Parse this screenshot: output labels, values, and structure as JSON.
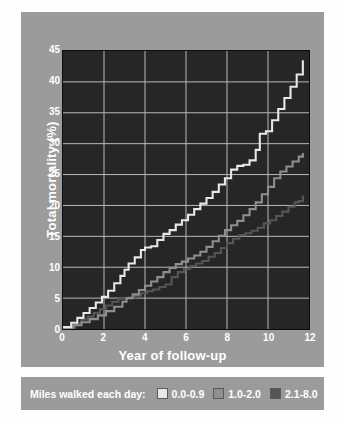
{
  "chart_data": {
    "type": "line",
    "title": "",
    "xlabel": "Year of follow-up",
    "ylabel": "Total mortality (%)",
    "xlim": [
      0,
      12
    ],
    "ylim": [
      0,
      45
    ],
    "xticks": [
      "0",
      "2",
      "4",
      "6",
      "8",
      "10",
      "12"
    ],
    "yticks": [
      "0",
      "5",
      "10",
      "15",
      "20",
      "25",
      "30",
      "35",
      "40",
      "45"
    ],
    "grid": true,
    "step_plot": true,
    "legend_position": "below-plot",
    "legend_title": "Miles walked each day:",
    "colors": {
      "panel_background": "#9b9b9b",
      "plot_background": "#262626",
      "grid": "#b9b9b9",
      "axis_text": "#ffffff",
      "series_0_0_9": "#e8e8e8",
      "series_1_0_2_0": "#8f8f8f",
      "series_2_1_8_0": "#555555"
    },
    "series": [
      {
        "name": "0.0-0.9",
        "color": "#e8e8e8",
        "x": [
          0,
          0.4,
          0.7,
          1.0,
          1.3,
          1.6,
          1.9,
          2.2,
          2.5,
          2.8,
          3.0,
          3.2,
          3.5,
          3.8,
          4.0,
          4.3,
          4.6,
          4.9,
          5.2,
          5.5,
          5.8,
          6.1,
          6.4,
          6.7,
          7.0,
          7.3,
          7.6,
          7.9,
          8.2,
          8.5,
          8.8,
          9.1,
          9.4,
          9.6,
          9.9,
          10.2,
          10.5,
          10.8,
          11.1,
          11.4,
          11.7
        ],
        "y": [
          0.3,
          1.0,
          1.8,
          2.6,
          3.4,
          4.3,
          5.2,
          6.2,
          7.4,
          8.6,
          9.6,
          10.6,
          11.6,
          12.8,
          13.2,
          13.4,
          14.4,
          15.4,
          16.0,
          16.9,
          17.6,
          18.5,
          19.4,
          20.3,
          21.2,
          22.2,
          23.4,
          24.4,
          25.8,
          26.4,
          26.6,
          27.3,
          29.0,
          31.6,
          32.0,
          33.8,
          35.6,
          37.4,
          39.2,
          41.2,
          43.5
        ]
      },
      {
        "name": "1.0-2.0",
        "color": "#8f8f8f",
        "x": [
          0,
          0.5,
          0.9,
          1.3,
          1.7,
          2.1,
          2.5,
          2.9,
          3.1,
          3.4,
          3.7,
          4.0,
          4.3,
          4.6,
          4.9,
          5.2,
          5.5,
          5.8,
          6.1,
          6.4,
          6.7,
          7.0,
          7.3,
          7.6,
          7.9,
          8.2,
          8.5,
          8.8,
          9.1,
          9.4,
          9.7,
          10.0,
          10.3,
          10.6,
          10.9,
          11.2,
          11.5,
          11.7
        ],
        "y": [
          0.2,
          0.6,
          1.1,
          1.6,
          2.2,
          2.9,
          3.6,
          4.4,
          5.0,
          5.6,
          6.3,
          7.0,
          7.7,
          8.4,
          9.2,
          9.9,
          10.5,
          10.9,
          11.4,
          11.9,
          12.5,
          13.3,
          14.2,
          15.1,
          16.0,
          16.8,
          17.5,
          18.4,
          19.4,
          20.5,
          21.8,
          23.0,
          24.4,
          25.5,
          26.3,
          27.1,
          27.9,
          28.5
        ]
      },
      {
        "name": "2.1-8.0",
        "color": "#555555",
        "x": [
          0,
          0.6,
          0.9,
          1.2,
          1.5,
          1.8,
          2.1,
          2.4,
          2.7,
          3.0,
          3.2,
          3.5,
          3.8,
          4.1,
          4.4,
          4.7,
          5.0,
          5.3,
          5.6,
          5.9,
          6.2,
          6.5,
          6.8,
          7.1,
          7.4,
          7.7,
          8.0,
          8.3,
          8.6,
          8.9,
          9.2,
          9.5,
          9.8,
          10.1,
          10.4,
          10.7,
          11.0,
          11.3,
          11.5,
          11.7
        ],
        "y": [
          0.2,
          0.9,
          1.5,
          2.0,
          2.6,
          3.2,
          3.8,
          4.4,
          4.9,
          5.0,
          5.1,
          5.4,
          5.8,
          6.1,
          6.4,
          6.8,
          7.2,
          8.4,
          9.2,
          9.7,
          10.2,
          10.6,
          11.0,
          11.7,
          12.3,
          13.1,
          13.9,
          14.6,
          15.2,
          15.5,
          15.9,
          16.4,
          17.1,
          17.6,
          18.3,
          19.0,
          19.8,
          20.5,
          20.7,
          21.6
        ]
      }
    ]
  },
  "legend": {
    "title": "Miles walked each day:",
    "entries": [
      {
        "label": "0.0-0.9",
        "color": "#e8e8e8"
      },
      {
        "label": "1.0-2.0",
        "color": "#8f8f8f"
      },
      {
        "label": "2.1-8.0",
        "color": "#555555"
      }
    ]
  },
  "axes": {
    "x_title": "Year of follow-up",
    "y_title": "Total mortality (%)"
  }
}
